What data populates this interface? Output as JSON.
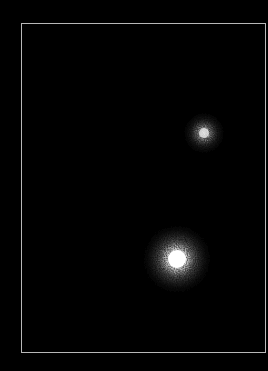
{
  "image": {
    "description": "Dark astronomical field with two point sources inside a thin grey frame",
    "background_color": "#000000",
    "frame_color": "#b8b8b8"
  },
  "frame": {
    "left": 21,
    "top": 23,
    "width": 245,
    "height": 330
  },
  "sources": [
    {
      "name": "upper-star",
      "center_x": 203,
      "center_y": 132,
      "core_radius": 6,
      "halo_radius": 22,
      "brightness": "medium"
    },
    {
      "name": "lower-star",
      "center_x": 176,
      "center_y": 258,
      "core_radius": 10,
      "halo_radius": 38,
      "brightness": "high"
    }
  ]
}
